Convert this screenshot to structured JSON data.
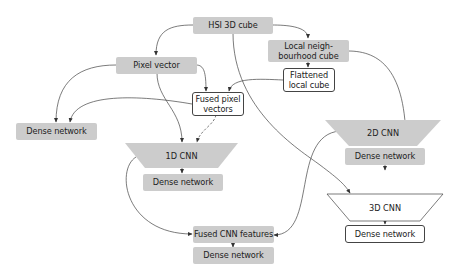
{
  "diagram": {
    "type": "flowchart",
    "colors": {
      "gray_fill": "#cccccc",
      "white_fill": "#ffffff",
      "stroke": "#444444",
      "text": "#222222"
    },
    "nodes": {
      "hsi_cube": "HSI 3D cube",
      "local_cube_line1": "Local neigh-",
      "local_cube_line2": "bourhood cube",
      "flattened_line1": "Flattened",
      "flattened_line2": "local cube",
      "pixel_vector": "Pixel vector",
      "fused_pixel_line1": "Fused pixel",
      "fused_pixel_line2": "vectors",
      "dense_left": "Dense network",
      "cnn_1d": "1D CNN",
      "dense_1d": "Dense network",
      "cnn_2d": "2D CNN",
      "dense_2d": "Dense network",
      "cnn_3d": "3D CNN",
      "dense_3d": "Dense network",
      "fused_cnn": "Fused CNN features",
      "dense_bottom": "Dense network"
    },
    "edges": [
      {
        "from": "HSI 3D cube",
        "to": "Pixel vector"
      },
      {
        "from": "HSI 3D cube",
        "to": "Local neighbourhood cube"
      },
      {
        "from": "HSI 3D cube",
        "to": "3D CNN"
      },
      {
        "from": "Local neighbourhood cube",
        "to": "Flattened local cube"
      },
      {
        "from": "Local neighbourhood cube",
        "to": "2D CNN"
      },
      {
        "from": "Flattened local cube",
        "to": "Fused pixel vectors"
      },
      {
        "from": "Pixel vector",
        "to": "Fused pixel vectors"
      },
      {
        "from": "Pixel vector",
        "to": "Dense network (left)"
      },
      {
        "from": "Pixel vector",
        "to": "1D CNN"
      },
      {
        "from": "Fused pixel vectors",
        "to": "Dense network (left)"
      },
      {
        "from": "Fused pixel vectors",
        "to": "1D CNN",
        "style": "dashed"
      },
      {
        "from": "1D CNN",
        "to": "Dense network (1D)"
      },
      {
        "from": "1D CNN",
        "to": "Fused CNN features"
      },
      {
        "from": "2D CNN",
        "to": "Dense network (2D)"
      },
      {
        "from": "2D CNN",
        "to": "Fused CNN features"
      },
      {
        "from": "3D CNN",
        "to": "Dense network (3D)"
      },
      {
        "from": "Fused CNN features",
        "to": "Dense network (bottom)"
      }
    ]
  }
}
